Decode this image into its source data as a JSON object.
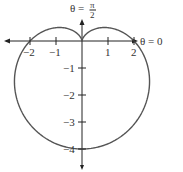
{
  "chart_data": {
    "type": "line",
    "plot_kind": "polar",
    "equation": "r = 2 - 2 sin(theta)",
    "title": "",
    "annotations": {
      "theta_zero_label": "θ = 0",
      "theta_half_pi_label_top": "π",
      "theta_half_pi_label_bottom": "2",
      "theta_half_pi_prefix": "θ ="
    },
    "x_ticks": [
      {
        "value": -2,
        "label": "−2"
      },
      {
        "value": -1,
        "label": "−1"
      },
      {
        "value": 1,
        "label": "1"
      },
      {
        "value": 2,
        "label": "2"
      }
    ],
    "y_ticks": [
      {
        "value": -1,
        "label": "−1"
      },
      {
        "value": -2,
        "label": "−2"
      },
      {
        "value": -3,
        "label": "−3"
      },
      {
        "value": -4,
        "label": "−4"
      }
    ],
    "xlim": [
      -3,
      3
    ],
    "ylim": [
      -4.8,
      1.6
    ],
    "grid": false,
    "curve_color": "#555555"
  }
}
